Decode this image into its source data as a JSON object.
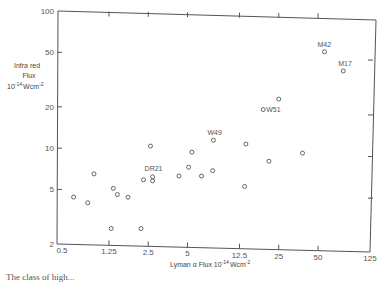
{
  "chart_data": {
    "type": "scatter",
    "title": "",
    "xlabel": "Lyman α Flux 10^-14 Wcm^-2",
    "ylabel": "Infra red Flux 10^-14 Wcm^-2",
    "xscale": "log",
    "yscale": "log",
    "xlim": [
      0.5,
      125
    ],
    "ylim": [
      2,
      100
    ],
    "x_ticks": [
      0.5,
      1.25,
      2.5,
      5,
      12.5,
      25,
      50,
      125
    ],
    "x_tick_labels": [
      "0.5",
      "1.25",
      "2.5",
      "5",
      "12.5",
      "25",
      "50",
      "125"
    ],
    "y_ticks": [
      2,
      5,
      10,
      20,
      50,
      100
    ],
    "y_tick_labels": [
      "2",
      "5",
      "10",
      "20",
      "50",
      "100"
    ],
    "grid": false,
    "legend": null,
    "marker": "open-circle",
    "points": [
      {
        "x": 0.67,
        "y": 4.4,
        "label": ""
      },
      {
        "x": 0.86,
        "y": 4.0,
        "label": ""
      },
      {
        "x": 0.96,
        "y": 6.5,
        "label": ""
      },
      {
        "x": 1.3,
        "y": 2.6,
        "label": ""
      },
      {
        "x": 1.35,
        "y": 5.1,
        "label": ""
      },
      {
        "x": 1.45,
        "y": 4.6,
        "label": ""
      },
      {
        "x": 1.75,
        "y": 4.4,
        "label": ""
      },
      {
        "x": 2.2,
        "y": 2.6,
        "label": ""
      },
      {
        "x": 2.3,
        "y": 5.9,
        "label": ""
      },
      {
        "x": 2.6,
        "y": 10.4,
        "label": ""
      },
      {
        "x": 2.7,
        "y": 6.2,
        "label": "DR21"
      },
      {
        "x": 2.7,
        "y": 5.8,
        "label": ""
      },
      {
        "x": 4.3,
        "y": 6.3,
        "label": ""
      },
      {
        "x": 5.1,
        "y": 7.3,
        "label": ""
      },
      {
        "x": 5.4,
        "y": 9.4,
        "label": ""
      },
      {
        "x": 6.4,
        "y": 6.3,
        "label": ""
      },
      {
        "x": 7.8,
        "y": 6.9,
        "label": ""
      },
      {
        "x": 7.9,
        "y": 11.5,
        "label": "W49"
      },
      {
        "x": 13.7,
        "y": 5.3,
        "label": ""
      },
      {
        "x": 14.0,
        "y": 10.8,
        "label": ""
      },
      {
        "x": 19,
        "y": 19.3,
        "label": "W51"
      },
      {
        "x": 21,
        "y": 8.1,
        "label": ""
      },
      {
        "x": 25,
        "y": 23,
        "label": ""
      },
      {
        "x": 38,
        "y": 9.3,
        "label": ""
      },
      {
        "x": 56,
        "y": 51,
        "label": "M42"
      },
      {
        "x": 78,
        "y": 37,
        "label": "M17"
      }
    ],
    "annotations": [
      "DR21",
      "W49",
      "W51",
      "M42",
      "M17"
    ]
  },
  "labels": {
    "ylabel_line1": "Infra red",
    "ylabel_line2": "Flux",
    "ylabel_line3_base": "10",
    "ylabel_line3_exp": "-14",
    "ylabel_line3_unit": "Wcm",
    "ylabel_line3_unit_exp": "-2",
    "xlabel_base": "Lyman α Flux 10",
    "xlabel_exp": "-14",
    "xlabel_unit": "Wcm",
    "xlabel_unit_exp": "-2"
  },
  "caption": "The class of high..."
}
